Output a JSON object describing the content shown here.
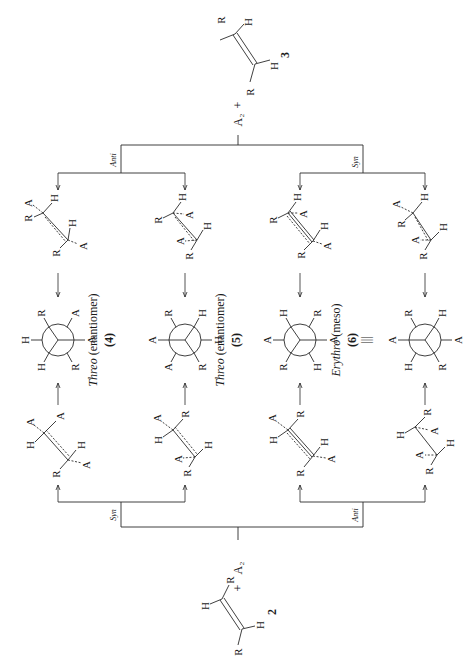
{
  "figure": {
    "orientation": "rotated-90-ccw",
    "reactant_top": {
      "label": "3",
      "atoms": [
        "R",
        "H",
        "R",
        "H"
      ],
      "reagent": "A₂",
      "plus": "+"
    },
    "reactant_bottom": {
      "label": "2",
      "atoms": [
        "H",
        "R",
        "R",
        "H"
      ],
      "reagent": "A₂",
      "plus": "+"
    },
    "top_branch": {
      "left": "Anti",
      "right": "Syn"
    },
    "bottom_branch": {
      "left": "Syn",
      "right": "Anti"
    },
    "products": [
      {
        "name": "Threo",
        "qualifier": "(enantiomer)",
        "number": "(4)",
        "newman": {
          "front": [
            "H",
            "R",
            "A"
          ],
          "back": [
            "H",
            "R",
            "A"
          ]
        }
      },
      {
        "name": "Threo",
        "qualifier": "(enantiomer)",
        "number": "(5)",
        "newman": {
          "front": [
            "A",
            "R",
            "H"
          ],
          "back": [
            "A",
            "R",
            "H"
          ]
        }
      },
      {
        "name": "Erythro",
        "qualifier": "(meso)",
        "number": "(6)",
        "equiv": "|||",
        "newman": {
          "front": [
            "A",
            "R",
            "H"
          ],
          "back": [
            "A",
            "R",
            "H"
          ]
        }
      },
      {
        "name": "",
        "qualifier": "",
        "number": "",
        "newman": {
          "front": [
            "A",
            "R",
            "H"
          ],
          "back": [
            "A",
            "R",
            "H"
          ]
        }
      }
    ],
    "atoms": {
      "R": "R",
      "H": "H",
      "A": "A"
    }
  }
}
